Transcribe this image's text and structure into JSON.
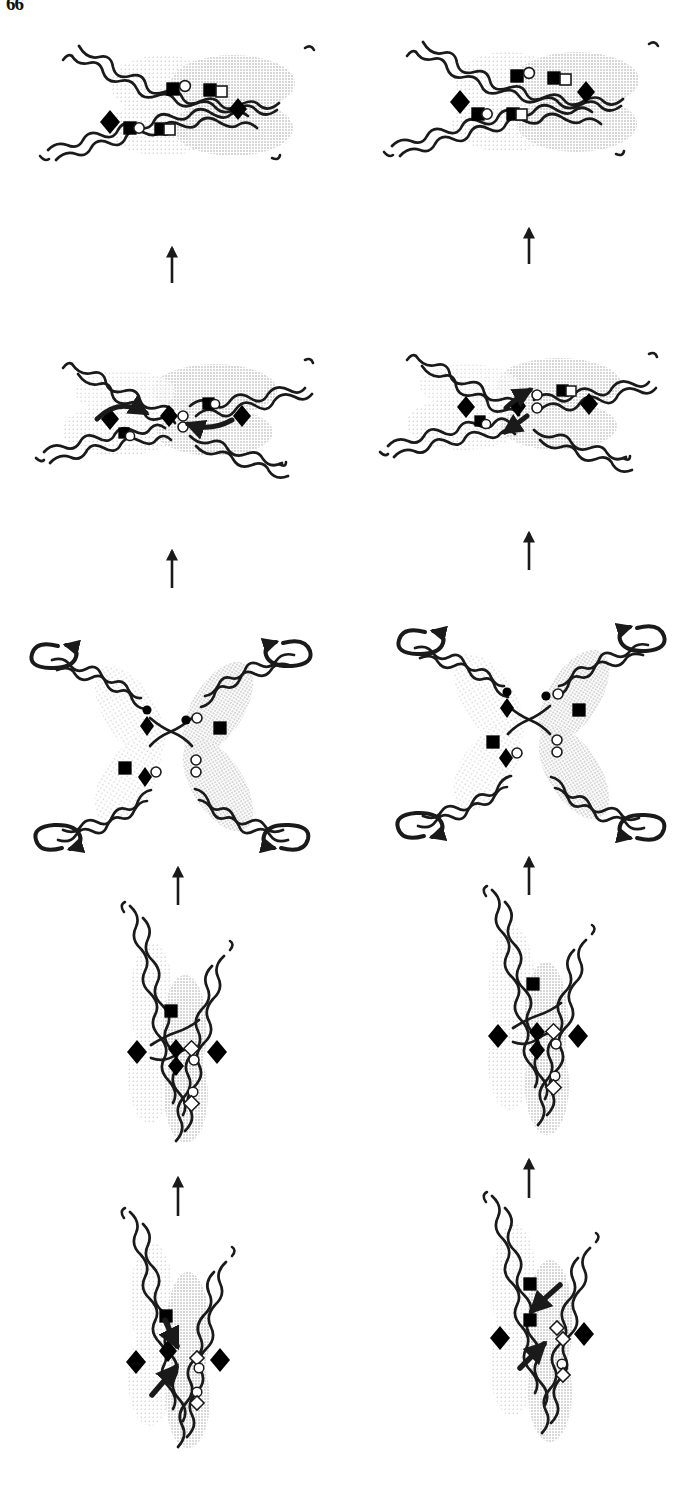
{
  "figure": {
    "page_number": "66",
    "background_color": "#ffffff",
    "ink_color": "#1a1a1a",
    "shade_color": "#b8b8b8",
    "shade_color_light": "#d8d8d8",
    "reading_direction": "bottom-to-top",
    "columns": 2,
    "rows": 5
  },
  "legend": {
    "markers": [
      {
        "key": "filled-square",
        "shape": "square",
        "fill": "#000000",
        "label": "filled square"
      },
      {
        "key": "open-square",
        "shape": "square",
        "fill": "#ffffff",
        "label": "open square"
      },
      {
        "key": "filled-diamond",
        "shape": "diamond",
        "fill": "#000000",
        "label": "filled diamond"
      },
      {
        "key": "open-circle",
        "shape": "circle",
        "fill": "#ffffff",
        "label": "open circle"
      },
      {
        "key": "filled-circle",
        "shape": "circle",
        "fill": "#000000",
        "label": "filled circle"
      }
    ]
  },
  "panels": [
    {
      "id": "panel-r5-left",
      "row": 5,
      "column": "left",
      "caption": "Resolved recombinant duplexes, horizontal orientation",
      "orientation": "horizontal",
      "markers": [
        "filled-square",
        "open-circle",
        "filled-square",
        "open-square",
        "filled-diamond",
        "filled-diamond",
        "filled-square",
        "open-circle",
        "filled-square",
        "open-square"
      ],
      "arrows": []
    },
    {
      "id": "panel-r5-right",
      "row": 5,
      "column": "right",
      "caption": "Resolved recombinant duplexes, horizontal orientation",
      "orientation": "horizontal",
      "markers": [
        "filled-square",
        "open-circle",
        "filled-square",
        "open-square",
        "filled-diamond",
        "filled-diamond",
        "filled-square",
        "open-circle",
        "filled-square",
        "open-square"
      ],
      "arrows": []
    },
    {
      "id": "panel-r4-left",
      "row": 4,
      "column": "left",
      "caption": "Branch migration along paired duplexes with curved exchange arrows",
      "orientation": "horizontal",
      "markers": [
        "filled-diamond",
        "filled-square",
        "open-circle",
        "filled-diamond",
        "open-circle",
        "open-circle",
        "filled-square",
        "open-square",
        "filled-diamond"
      ],
      "arrows": [
        "curved-right",
        "curved-left"
      ]
    },
    {
      "id": "panel-r4-right",
      "row": 4,
      "column": "right",
      "caption": "Strand invasion with converging arrows at the junction",
      "orientation": "horizontal",
      "markers": [
        "filled-diamond",
        "filled-square",
        "open-circle",
        "filled-diamond",
        "open-circle",
        "open-circle",
        "filled-square",
        "open-square",
        "filled-diamond"
      ],
      "arrows": [
        "diagonal-up-right",
        "diagonal-up-left"
      ]
    },
    {
      "id": "panel-r3-left",
      "row": 3,
      "column": "left",
      "caption": "Open X-shaped Holliday junction with four rotating arms",
      "orientation": "x-junction",
      "markers": [
        "filled-diamond",
        "filled-circle",
        "open-circle",
        "filled-square",
        "filled-square",
        "filled-diamond",
        "open-circle",
        "open-circle"
      ],
      "arrows": [
        "rotation-top-left",
        "rotation-top-right",
        "rotation-bottom-left",
        "rotation-bottom-right"
      ]
    },
    {
      "id": "panel-r3-right",
      "row": 3,
      "column": "right",
      "caption": "Open X-shaped Holliday junction with four rotating arms",
      "orientation": "x-junction",
      "markers": [
        "filled-diamond",
        "filled-circle",
        "open-circle",
        "filled-square",
        "filled-square",
        "filled-diamond",
        "open-circle",
        "open-circle"
      ],
      "arrows": [
        "rotation-top-left",
        "rotation-top-right",
        "rotation-bottom-left",
        "rotation-bottom-right"
      ]
    },
    {
      "id": "panel-r2-left",
      "row": 2,
      "column": "left",
      "caption": "Vertical paired duplexes crossed at a single junction",
      "orientation": "vertical",
      "markers": [
        "filled-square",
        "filled-diamond",
        "open-square",
        "filled-diamond",
        "filled-diamond",
        "filled-diamond",
        "open-circle",
        "open-square"
      ],
      "arrows": []
    },
    {
      "id": "panel-r2-right",
      "row": 2,
      "column": "right",
      "caption": "Vertical paired duplexes crossed at a single junction",
      "orientation": "vertical",
      "markers": [
        "filled-square",
        "filled-diamond",
        "open-square",
        "filled-diamond",
        "filled-diamond",
        "filled-diamond",
        "open-circle",
        "open-square"
      ],
      "arrows": []
    },
    {
      "id": "panel-r1-left",
      "row": 1,
      "column": "left",
      "caption": "Initial strand invasion into the vertical homologous duplex",
      "orientation": "vertical",
      "markers": [
        "filled-square",
        "filled-diamond",
        "filled-diamond",
        "filled-diamond",
        "open-square",
        "open-circle",
        "open-square"
      ],
      "arrows": [
        "invasion-down-right",
        "invasion-up-right"
      ]
    },
    {
      "id": "panel-r1-right",
      "row": 1,
      "column": "right",
      "caption": "Initial strand invasion into the vertical homologous duplex",
      "orientation": "vertical",
      "markers": [
        "filled-square",
        "filled-diamond",
        "filled-diamond",
        "filled-diamond",
        "open-square",
        "open-circle",
        "open-square"
      ],
      "arrows": [
        "invasion-down-left",
        "invasion-up-right"
      ]
    }
  ],
  "step_arrows": [
    {
      "id": "arrow-left-1",
      "column": "left",
      "between": "row1-row2",
      "direction": "up"
    },
    {
      "id": "arrow-right-1",
      "column": "right",
      "between": "row1-row2",
      "direction": "up"
    },
    {
      "id": "arrow-left-2",
      "column": "left",
      "between": "row2-row3",
      "direction": "up"
    },
    {
      "id": "arrow-right-2",
      "column": "right",
      "between": "row2-row3",
      "direction": "up"
    },
    {
      "id": "arrow-left-3",
      "column": "left",
      "between": "row3-row4",
      "direction": "up"
    },
    {
      "id": "arrow-right-3",
      "column": "right",
      "between": "row3-row4",
      "direction": "up"
    },
    {
      "id": "arrow-left-4",
      "column": "left",
      "between": "row4-row5",
      "direction": "up"
    },
    {
      "id": "arrow-right-4",
      "column": "right",
      "between": "row4-row5",
      "direction": "up"
    }
  ]
}
